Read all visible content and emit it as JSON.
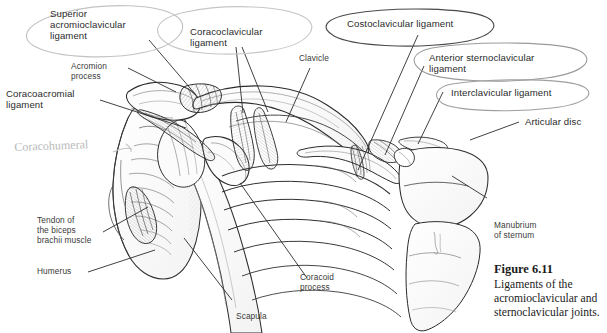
{
  "figure": {
    "number": "Figure 6.11",
    "caption_lines": [
      "Ligaments of the",
      "acromioclavicular and",
      "sternoclavicular joints."
    ],
    "background_color": "#ffffff",
    "ink_color": "#2b2b2b",
    "pencil_annotation_color": "#bdbdbd"
  },
  "labels": {
    "superior_acromioclavicular_ligament": "Superior\nacromioclavicular\nligament",
    "coracoclavicular_ligament": "Coracoclavicular\nligament",
    "costoclavicular_ligament": "Costoclavicular ligament",
    "anterior_sternoclavicular_ligament": "Anterior sternoclavicular\nligament",
    "interclavicular_ligament": "Interclavicular ligament",
    "articular_disc": "Articular disc",
    "clavicle": "Clavicle",
    "acromion_process": "Acromion\nprocess",
    "coracoacromial_ligament": "Coracoacromial\nligament",
    "tendon_of_biceps": "Tendon of\nthe biceps\nbrachii muscle",
    "humerus": "Humerus",
    "scapula": "Scapula",
    "coracoid_process": "Coracoid\nprocess",
    "manubrium_of_sternum": "Manubrium\nof sternum"
  },
  "handwriting": {
    "coracohumeral": "Coracohumeral"
  },
  "annotations": {
    "circled_labels": [
      "Superior acromioclavicular ligament",
      "Coracoclavicular ligament",
      "Costoclavicular ligament",
      "Anterior sternoclavicular ligament",
      "Interclavicular ligament"
    ]
  }
}
